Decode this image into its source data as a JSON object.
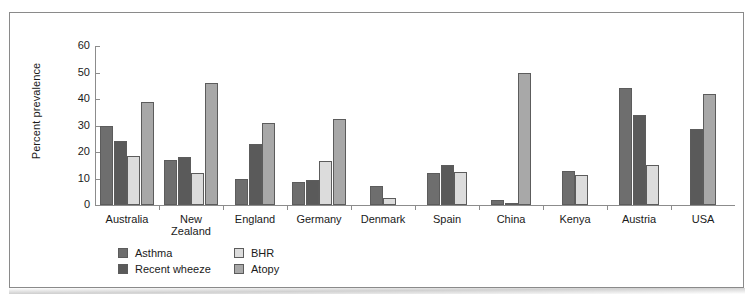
{
  "chart_data": {
    "type": "bar",
    "title": "",
    "xlabel": "",
    "ylabel": "Percent prevalence",
    "ylim": [
      0,
      60
    ],
    "yticks": [
      0,
      10,
      20,
      30,
      40,
      50,
      60
    ],
    "grid": false,
    "legend_position": "bottom-left",
    "categories": [
      "Australia",
      "New Zealand",
      "England",
      "Germany",
      "Denmark",
      "Spain",
      "China",
      "Kenya",
      "Austria",
      "USA"
    ],
    "series": [
      {
        "name": "Asthma",
        "color": "#6e6e6e",
        "values": [
          30,
          17,
          10,
          8.5,
          7,
          12,
          2,
          13,
          44,
          null
        ]
      },
      {
        "name": "Recent wheeze",
        "color": "#5a5a5a",
        "values": [
          24,
          18,
          23,
          9.5,
          null,
          15,
          null,
          null,
          34,
          28.5
        ]
      },
      {
        "name": "BHR",
        "color": "#dcdcdc",
        "values": [
          18.5,
          12,
          null,
          16.5,
          2.5,
          12.5,
          0.6,
          11.5,
          15,
          null
        ]
      },
      {
        "name": "Atopy",
        "color": "#a8a8a8",
        "values": [
          39,
          46,
          31,
          32.5,
          null,
          null,
          50,
          null,
          null,
          42
        ]
      }
    ]
  },
  "axis": {
    "y_tick_labels": [
      "0",
      "10",
      "20",
      "30",
      "40",
      "50",
      "60"
    ],
    "y_axis_title": "Percent prevalence"
  },
  "legend": {
    "entries": [
      {
        "label": "Asthma",
        "swatch": "#6e6e6e"
      },
      {
        "label": "BHR",
        "swatch": "#dcdcdc"
      },
      {
        "label": "Recent wheeze",
        "swatch": "#5a5a5a"
      },
      {
        "label": "Atopy",
        "swatch": "#a8a8a8"
      }
    ]
  }
}
